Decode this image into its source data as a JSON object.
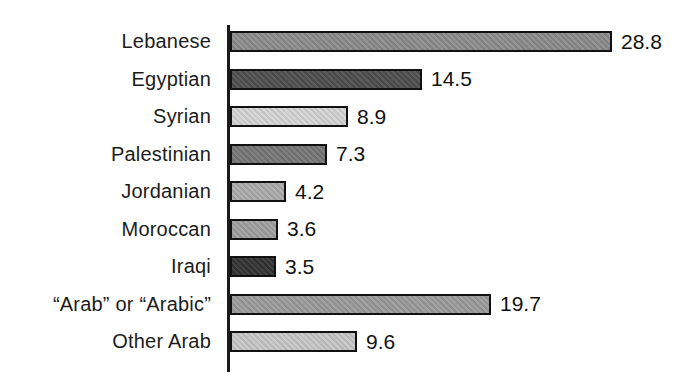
{
  "chart_data": {
    "type": "bar",
    "orientation": "horizontal",
    "categories": [
      "Lebanese",
      "Egyptian",
      "Syrian",
      "Palestinian",
      "Jordanian",
      "Moroccan",
      "Iraqi",
      "“Arab” or “Arabic”",
      "Other Arab"
    ],
    "values": [
      28.8,
      14.5,
      8.9,
      7.3,
      4.2,
      3.6,
      3.5,
      19.7,
      9.6
    ],
    "value_labels": [
      "28.8",
      "14.5",
      "8.9",
      "7.3",
      "4.2",
      "3.6",
      "3.5",
      "19.7",
      "9.6"
    ],
    "bar_colors": [
      "#8c8c8c",
      "#4f4f4f",
      "#d4d4d4",
      "#767676",
      "#ababab",
      "#9f9f9f",
      "#333333",
      "#9b9b9b",
      "#c6c6c6"
    ],
    "title": "",
    "xlabel": "",
    "ylabel": "",
    "xlim": [
      0,
      30
    ],
    "grid": false,
    "legend": false,
    "value_labels_shown": true,
    "axis_color": "#1a1a1a",
    "bar_border_color": "#111111",
    "background": "#ffffff"
  }
}
